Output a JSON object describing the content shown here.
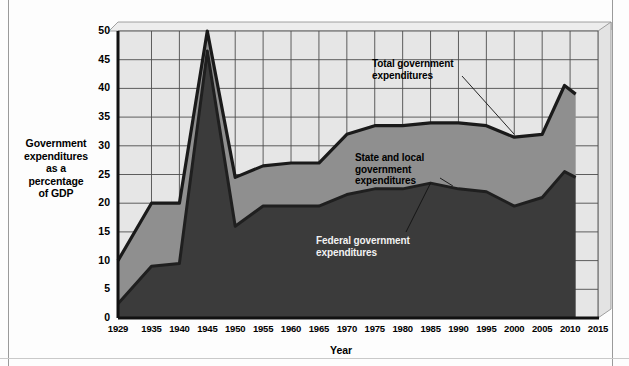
{
  "chart_data": {
    "type": "area",
    "title": "",
    "subtitle": "",
    "xlabel": "Year",
    "ylabel": "Government expenditures as a percentage of GDP",
    "ylabel_lines": [
      "Government",
      "expenditures",
      "as a",
      "percentage",
      "of GDP"
    ],
    "ylim": [
      0,
      50
    ],
    "yticks": [
      0,
      5,
      10,
      15,
      20,
      25,
      30,
      35,
      40,
      45,
      50
    ],
    "xlim": [
      1929,
      2015
    ],
    "xticks": [
      1929,
      1935,
      1940,
      1945,
      1950,
      1955,
      1960,
      1965,
      1970,
      1975,
      1980,
      1985,
      1990,
      1995,
      2000,
      2005,
      2010,
      2015
    ],
    "grid": true,
    "legend_position": "annotations-inline",
    "stacked": true,
    "x": [
      1929,
      1935,
      1940,
      1945,
      1950,
      1955,
      1960,
      1965,
      1970,
      1975,
      1980,
      1985,
      1990,
      1995,
      2000,
      2005,
      2009,
      2011
    ],
    "series": [
      {
        "name": "Federal government expenditures",
        "color": "#3b3b3b",
        "values": [
          2.5,
          9.0,
          9.5,
          46.5,
          16.0,
          19.5,
          19.5,
          19.5,
          21.5,
          22.5,
          22.5,
          23.5,
          22.5,
          22.0,
          19.5,
          21.0,
          25.5,
          24.5
        ]
      },
      {
        "name": "State and local government expenditures",
        "color": "#8f8f8f",
        "values": [
          7.5,
          11.0,
          10.5,
          3.5,
          8.5,
          7.0,
          7.5,
          7.5,
          10.5,
          11.0,
          11.0,
          10.5,
          11.5,
          11.5,
          12.0,
          11.0,
          15.0,
          14.5
        ]
      }
    ],
    "total_series": {
      "name": "Total government expenditures",
      "color": "#1a1a1a",
      "values": [
        10.0,
        20.0,
        20.0,
        50.0,
        24.5,
        26.5,
        27.0,
        27.0,
        32.0,
        33.5,
        33.5,
        34.0,
        34.0,
        33.5,
        31.5,
        32.0,
        40.5,
        39.0
      ]
    },
    "annotations": [
      {
        "text_lines": [
          "Total government",
          "expenditures"
        ],
        "target_year": 2000,
        "target_value": 32.0
      },
      {
        "text_lines": [
          "State and local",
          "government",
          "expenditures"
        ],
        "target_year": 1990,
        "target_value": 23.0
      },
      {
        "text_lines": [
          "Federal government",
          "expenditures"
        ],
        "target_year": 1985,
        "target_value": 23.5
      }
    ],
    "plot_bg": "#e6e6e6",
    "grid_color": "#4d4d4d"
  },
  "axis": {
    "y_ticks": [
      "0",
      "5",
      "10",
      "15",
      "20",
      "25",
      "30",
      "35",
      "40",
      "45",
      "50"
    ],
    "x_ticks": [
      "1929",
      "1935",
      "1940",
      "1945",
      "1950",
      "1955",
      "1960",
      "1965",
      "1970",
      "1975",
      "1980",
      "1985",
      "1990",
      "1995",
      "2000",
      "2005",
      "2010",
      "2015"
    ],
    "x_title": "Year"
  },
  "ylabel": {
    "line1": "Government",
    "line2": "expenditures",
    "line3": "as a",
    "line4": "percentage",
    "line5": "of GDP"
  },
  "annotations": {
    "total": {
      "line1": "Total government",
      "line2": "expenditures"
    },
    "state_local": {
      "line1": "State and local",
      "line2": "government",
      "line3": "expenditures"
    },
    "federal": {
      "line1": "Federal government",
      "line2": "expenditures"
    }
  }
}
